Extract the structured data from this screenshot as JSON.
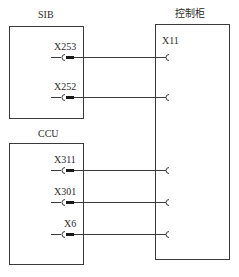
{
  "diagram": {
    "type": "wiring-connection",
    "blocks": [
      {
        "id": "sib",
        "title": "SIB",
        "connectors": [
          "X253",
          "X252"
        ]
      },
      {
        "id": "ccu",
        "title": "CCU",
        "connectors": [
          "X311",
          "X301",
          "X6"
        ]
      },
      {
        "id": "cabinet",
        "title": "控制柜",
        "connectors": [
          "X11"
        ]
      }
    ],
    "connections": [
      {
        "from": "SIB.X253",
        "to": "控制柜.X11"
      },
      {
        "from": "SIB.X252",
        "to": "控制柜.X11"
      },
      {
        "from": "CCU.X311",
        "to": "控制柜.X11"
      },
      {
        "from": "CCU.X301",
        "to": "控制柜.X11"
      },
      {
        "from": "CCU.X6",
        "to": "控制柜.X11"
      }
    ]
  },
  "sib": {
    "title": "SIB",
    "x253": "X253",
    "x252": "X252"
  },
  "ccu": {
    "title": "CCU",
    "x311": "X311",
    "x301": "X301",
    "x6": "X6"
  },
  "cabinet": {
    "title": "控制柜",
    "x11": "X11"
  },
  "colors": {
    "line": "#3a3a3a",
    "plug": "#1a1a1a"
  }
}
